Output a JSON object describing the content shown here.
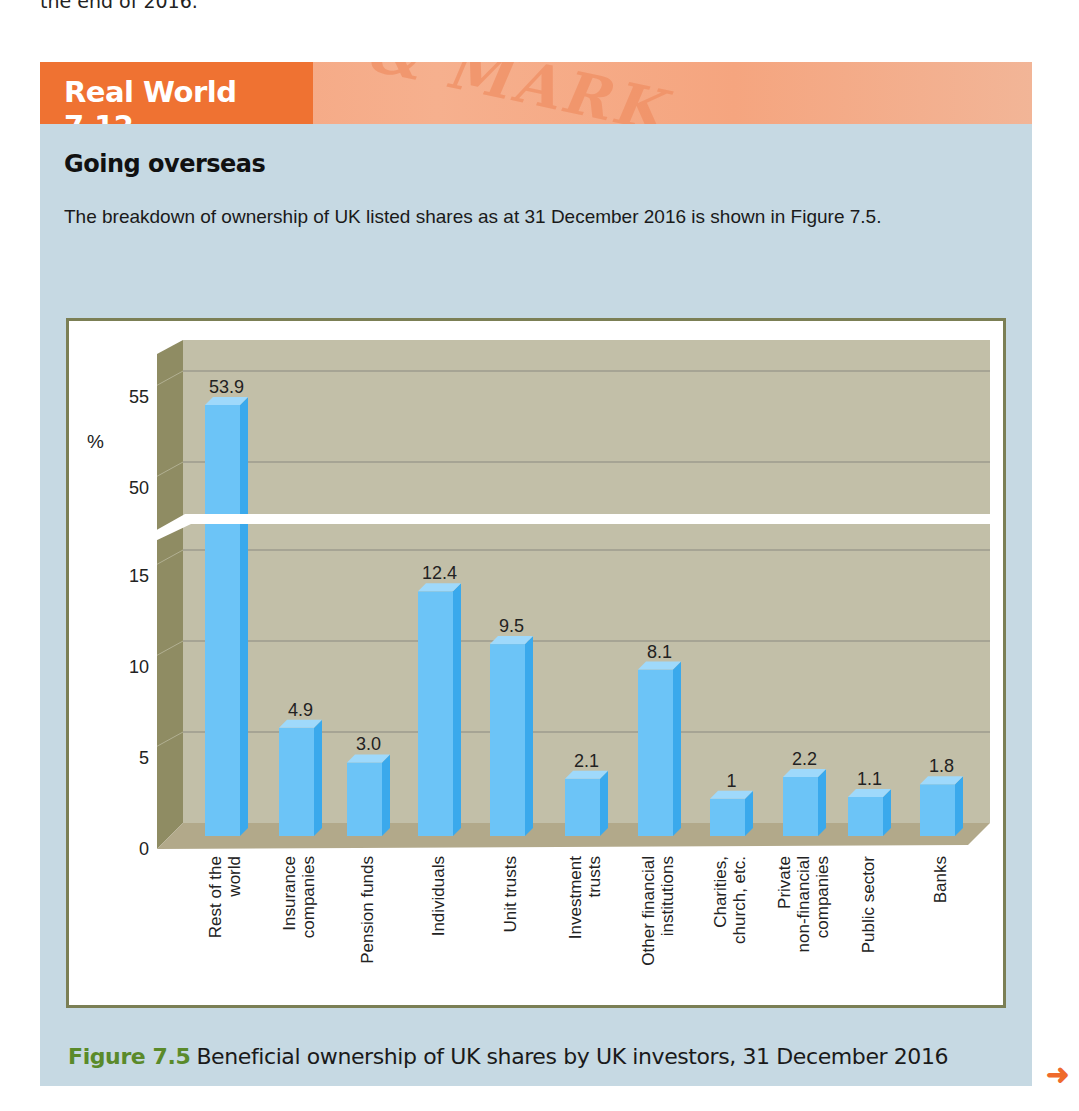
{
  "page": {
    "previous_text_fragment": "the end of 2016.",
    "banner_title": "Real World 7.12",
    "banner_background_text": "& MARK",
    "heading": "Going overseas",
    "intro": "The breakdown of ownership of UK listed shares as at 31 December 2016 is shown in Figure 7.5.",
    "caption_label": "Figure 7.5",
    "caption_text": "Beneficial ownership of UK shares by UK investors, 31 December 2016",
    "next_icon": "arrow-right-icon",
    "colors": {
      "banner_accent": "#ef7232",
      "box_background": "#c6d9e3",
      "bar_front": "#6cc4f7",
      "bar_side": "#3aa9ec",
      "bar_top": "#9fd9fb",
      "wall": "#c2bfa8",
      "side_wall": "#8f8c63",
      "caption_label": "#5a8a2a"
    }
  },
  "chart_data": {
    "type": "bar",
    "title": "Beneficial ownership of UK shares by UK investors, 31 December 2016",
    "xlabel": "",
    "ylabel": "%",
    "categories": [
      "Rest of the world",
      "Insurance companies",
      "Pension funds",
      "Individuals",
      "Unit trusts",
      "Investment trusts",
      "Other financial institutions",
      "Charities, church, etc.",
      "Private non-financial companies",
      "Public sector",
      "Banks"
    ],
    "category_label_lines": [
      [
        "Rest of the",
        "world"
      ],
      [
        "Insurance",
        "companies"
      ],
      [
        "Pension funds"
      ],
      [
        "Individuals"
      ],
      [
        "Unit trusts"
      ],
      [
        "Investment",
        "trusts"
      ],
      [
        "Other financial",
        "institutions"
      ],
      [
        "Charities,",
        "church, etc."
      ],
      [
        "Private",
        "non-financial",
        "companies"
      ],
      [
        "Public sector"
      ],
      [
        "Banks"
      ]
    ],
    "values": [
      53.9,
      4.9,
      3.0,
      12.4,
      9.5,
      2.1,
      8.1,
      1,
      2.2,
      1.1,
      1.8
    ],
    "value_labels": [
      "53.9",
      "4.9",
      "3.0",
      "12.4",
      "9.5",
      "2.1",
      "8.1",
      "1",
      "2.2",
      "1.1",
      "1.8"
    ],
    "y_axis_break": [
      17,
      48
    ],
    "ylim_lower": [
      0,
      17
    ],
    "ylim_upper": [
      48,
      57
    ],
    "y_ticks_lower": [
      0,
      5,
      10,
      15
    ],
    "y_ticks_upper": [
      50,
      55
    ],
    "grid": true,
    "style": "3d-column",
    "legend": "none"
  }
}
